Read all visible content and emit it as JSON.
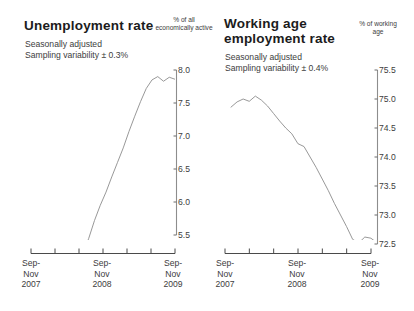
{
  "charts": [
    {
      "title": "Unemployment rate",
      "subtitle_1": "Seasonally adjusted",
      "subtitle_2": "Sampling variability ± 0.3%",
      "unit_label": "% of all\neconomically\nactive",
      "y_ticks": [
        "8.0",
        "7.5",
        "7.0",
        "6.5",
        "6.0",
        "5.5"
      ],
      "x_ticks": [
        "Sep-\nNov\n2007",
        "Sep-\nNov\n2008",
        "Sep-\nNov\n2009"
      ]
    },
    {
      "title": "Working age\nemployment rate",
      "subtitle_1": "Seasonally adjusted",
      "subtitle_2": "Sampling variability ± 0.4%",
      "unit_label": "% of\nworking\nage",
      "y_ticks": [
        "75.5",
        "75.0",
        "74.5",
        "74.0",
        "73.5",
        "73.0",
        "72.5"
      ],
      "x_ticks": [
        "Sep-\nNov\n2007",
        "Sep-\nNov\n2008",
        "Sep-\nNov\n2009"
      ]
    }
  ],
  "chart_data": [
    {
      "type": "line",
      "title": "Unemployment rate",
      "subtitle": "Seasonally adjusted. Sampling variability ± 0.3%",
      "xlabel": "",
      "ylabel": "% of all economically active",
      "ylim": [
        5.2,
        8.05
      ],
      "grid": false,
      "legend": "none",
      "line_color": "#8c8c8c",
      "x_tick_labels": [
        "Sep-Nov 2007",
        "Sep-Nov 2008",
        "Sep-Nov 2009"
      ],
      "x_minor_tick_count": 7,
      "x": [
        "Sep-Nov 2007",
        "Oct-Dec 2007",
        "Nov-Jan 2008",
        "Dec-Feb 2008",
        "Jan-Mar 2008",
        "Feb-Apr 2008",
        "Mar-May 2008",
        "Apr-Jun 2008",
        "May-Jul 2008",
        "Jun-Aug 2008",
        "Jul-Sep 2008",
        "Aug-Oct 2008",
        "Sep-Nov 2008",
        "Oct-Dec 2008",
        "Nov-Jan 2009",
        "Dec-Feb 2009",
        "Jan-Mar 2009",
        "Feb-Apr 2009",
        "Mar-May 2009",
        "Apr-Jun 2009",
        "May-Jul 2009",
        "Jun-Aug 2009",
        "Jul-Sep 2009",
        "Aug-Oct 2009",
        "Sep-Nov 2009"
      ],
      "values": [
        5.33,
        5.26,
        5.24,
        5.24,
        5.25,
        5.25,
        5.26,
        5.37,
        5.22,
        5.45,
        5.72,
        5.95,
        6.15,
        6.38,
        6.6,
        6.82,
        7.07,
        7.3,
        7.52,
        7.72,
        7.85,
        7.9,
        7.83,
        7.89,
        7.86
      ]
    },
    {
      "type": "line",
      "title": "Working age employment rate",
      "subtitle": "Seasonally adjusted. Sampling variability ± 0.4%",
      "xlabel": "",
      "ylabel": "% of working age",
      "ylim": [
        72.4,
        75.55
      ],
      "grid": false,
      "legend": "none",
      "line_color": "#8c8c8c",
      "x_tick_labels": [
        "Sep-Nov 2007",
        "Sep-Nov 2008",
        "Sep-Nov 2009"
      ],
      "x_minor_tick_count": 7,
      "x": [
        "Sep-Nov 2007",
        "Oct-Dec 2007",
        "Nov-Jan 2008",
        "Dec-Feb 2008",
        "Jan-Mar 2008",
        "Feb-Apr 2008",
        "Mar-May 2008",
        "Apr-Jun 2008",
        "May-Jul 2008",
        "Jun-Aug 2008",
        "Jul-Sep 2008",
        "Aug-Oct 2008",
        "Sep-Nov 2008",
        "Oct-Dec 2008",
        "Nov-Jan 2009",
        "Dec-Feb 2009",
        "Jan-Mar 2009",
        "Feb-Apr 2009",
        "Mar-May 2009",
        "Apr-Jun 2009",
        "May-Jul 2009",
        "Jun-Aug 2009",
        "Jul-Sep 2009",
        "Aug-Oct 2009",
        "Sep-Nov 2009"
      ],
      "values": [
        74.86,
        74.95,
        75.0,
        74.96,
        75.05,
        74.98,
        74.88,
        74.75,
        74.62,
        74.5,
        74.4,
        74.23,
        74.18,
        74.0,
        73.82,
        73.62,
        73.42,
        73.2,
        73.0,
        72.8,
        72.58,
        72.52,
        72.62,
        72.6,
        72.52
      ]
    }
  ]
}
